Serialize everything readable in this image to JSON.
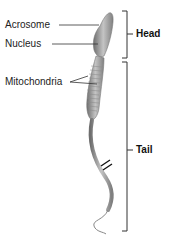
{
  "diagram": {
    "labels": {
      "acrosome": "Acrosome",
      "nucleus": "Nucleus",
      "mitochondria": "Mitochondria"
    },
    "regions": {
      "head": "Head",
      "tail": "Tail"
    },
    "colors": {
      "body": "#a8a8a8",
      "body_dark": "#7a7a7a",
      "lines": "#333333"
    }
  }
}
